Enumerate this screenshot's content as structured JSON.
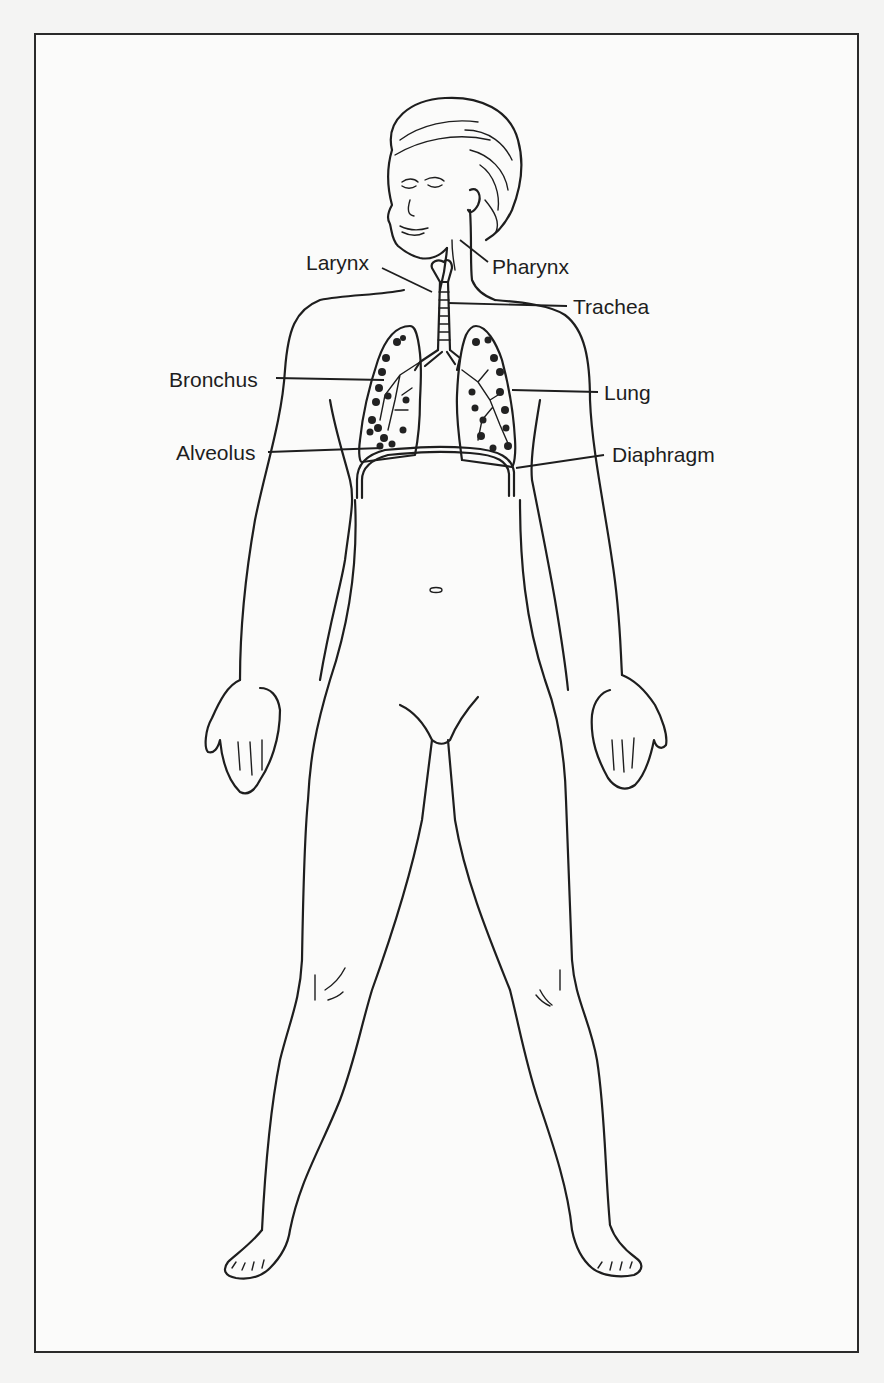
{
  "diagram": {
    "labels": {
      "larynx": "Larynx",
      "pharynx": "Pharynx",
      "trachea": "Trachea",
      "bronchus": "Bronchus",
      "lung": "Lung",
      "alveolus": "Alveolus",
      "diaphragm": "Diaphragm"
    }
  }
}
